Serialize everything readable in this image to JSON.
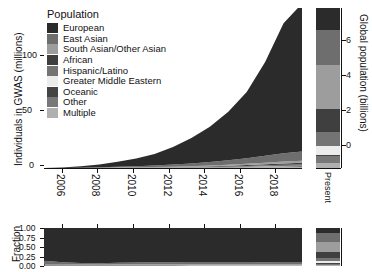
{
  "chart_data": {
    "type": "area",
    "title": "",
    "panels": {
      "main": {
        "type": "area",
        "ylabel": "Individuals in GWAS (millions)",
        "xlabel": "",
        "yticks": [
          0,
          50,
          100
        ],
        "ylim": [
          0,
          145
        ],
        "xticks": [
          "2006",
          "2008",
          "2010",
          "2012",
          "2014",
          "2016",
          "2018"
        ],
        "xlim": [
          2005,
          2019.5
        ],
        "grid": false,
        "x": [
          2005,
          2006,
          2007,
          2008,
          2009,
          2010,
          2011,
          2012,
          2013,
          2014,
          2015,
          2016,
          2017,
          2018,
          2019
        ],
        "series": [
          {
            "name": "European",
            "values": [
              0.1,
              0.4,
              1.2,
              2.6,
              4.5,
              7.0,
              10.5,
              16.0,
              23.0,
              32.0,
              44.0,
              60.0,
              85.0,
              118.0,
              134.0
            ]
          },
          {
            "name": "East Asian",
            "values": [
              0.0,
              0.1,
              0.2,
              0.4,
              0.7,
              1.0,
              1.4,
              1.9,
              2.5,
              3.2,
              4.0,
              5.0,
              6.2,
              7.5,
              8.4
            ]
          },
          {
            "name": "South Asian/Other Asian",
            "values": [
              0.0,
              0.0,
              0.05,
              0.1,
              0.15,
              0.2,
              0.3,
              0.4,
              0.5,
              0.7,
              0.9,
              1.1,
              1.4,
              1.7,
              1.9
            ]
          },
          {
            "name": "African",
            "values": [
              0.0,
              0.0,
              0.02,
              0.05,
              0.08,
              0.12,
              0.18,
              0.25,
              0.35,
              0.45,
              0.6,
              0.8,
              1.0,
              1.2,
              1.4
            ]
          },
          {
            "name": "Hispanic/Latino",
            "values": [
              0.0,
              0.0,
              0.02,
              0.04,
              0.07,
              0.1,
              0.15,
              0.2,
              0.3,
              0.4,
              0.5,
              0.65,
              0.85,
              1.0,
              1.15
            ]
          },
          {
            "name": "Greater Middle Eastern",
            "values": [
              0.0,
              0.0,
              0.0,
              0.01,
              0.02,
              0.03,
              0.04,
              0.06,
              0.08,
              0.1,
              0.13,
              0.16,
              0.2,
              0.24,
              0.27
            ]
          },
          {
            "name": "Oceanic",
            "values": [
              0.0,
              0.0,
              0.0,
              0.0,
              0.01,
              0.01,
              0.02,
              0.02,
              0.03,
              0.04,
              0.05,
              0.06,
              0.07,
              0.08,
              0.09
            ]
          },
          {
            "name": "Other",
            "values": [
              0.0,
              0.0,
              0.01,
              0.02,
              0.04,
              0.06,
              0.09,
              0.13,
              0.18,
              0.24,
              0.32,
              0.42,
              0.54,
              0.66,
              0.75
            ]
          },
          {
            "name": "Multiple",
            "values": [
              0.0,
              0.0,
              0.01,
              0.03,
              0.05,
              0.08,
              0.12,
              0.17,
              0.24,
              0.33,
              0.44,
              0.58,
              0.74,
              0.9,
              1.0
            ]
          }
        ]
      },
      "fraction": {
        "type": "area",
        "ylabel": "Fraction",
        "yticks": [
          "1.00",
          "0.75",
          "0.50",
          "0.25",
          "0.00"
        ],
        "ylim": [
          0,
          1
        ],
        "series": [
          {
            "name": "European",
            "values": [
              0.86,
              0.9,
              0.92,
              0.93,
              0.92,
              0.91,
              0.9,
              0.9,
              0.89,
              0.89,
              0.89,
              0.89,
              0.9,
              0.9,
              0.9
            ]
          },
          {
            "name": "East Asian",
            "values": [
              0.1,
              0.06,
              0.04,
              0.03,
              0.04,
              0.05,
              0.055,
              0.055,
              0.058,
              0.058,
              0.057,
              0.056,
              0.055,
              0.056,
              0.056
            ]
          },
          {
            "name": "South Asian/Other Asian",
            "values": [
              0.01,
              0.01,
              0.012,
              0.012,
              0.013,
              0.013,
              0.013,
              0.013,
              0.013,
              0.013,
              0.013,
              0.013,
              0.013,
              0.013,
              0.013
            ]
          },
          {
            "name": "African",
            "values": [
              0.01,
              0.01,
              0.009,
              0.009,
              0.009,
              0.009,
              0.009,
              0.009,
              0.009,
              0.009,
              0.009,
              0.009,
              0.009,
              0.009,
              0.009
            ]
          },
          {
            "name": "Hispanic/Latino",
            "values": [
              0.008,
              0.007,
              0.007,
              0.007,
              0.007,
              0.007,
              0.007,
              0.007,
              0.008,
              0.008,
              0.008,
              0.008,
              0.008,
              0.008,
              0.008
            ]
          },
          {
            "name": "Greater Middle Eastern",
            "values": [
              0.002,
              0.002,
              0.002,
              0.002,
              0.002,
              0.002,
              0.002,
              0.002,
              0.002,
              0.002,
              0.002,
              0.002,
              0.002,
              0.002,
              0.002
            ]
          },
          {
            "name": "Oceanic",
            "values": [
              0.001,
              0.001,
              0.001,
              0.001,
              0.001,
              0.001,
              0.001,
              0.001,
              0.001,
              0.001,
              0.001,
              0.001,
              0.001,
              0.001,
              0.001
            ]
          },
          {
            "name": "Other",
            "values": [
              0.004,
              0.005,
              0.005,
              0.005,
              0.005,
              0.005,
              0.005,
              0.005,
              0.005,
              0.005,
              0.005,
              0.005,
              0.005,
              0.005,
              0.005
            ]
          },
          {
            "name": "Multiple",
            "values": [
              0.005,
              0.005,
              0.005,
              0.006,
              0.006,
              0.007,
              0.008,
              0.008,
              0.009,
              0.009,
              0.009,
              0.009,
              0.009,
              0.009,
              0.009
            ]
          }
        ]
      },
      "present": {
        "type": "bar",
        "ylabel": "Global population (billions)",
        "xlabel": "Present",
        "yticks": [
          0,
          2,
          4,
          6
        ],
        "ylim": [
          0,
          7.6
        ],
        "segments": [
          {
            "name": "European",
            "value": 1.05
          },
          {
            "name": "East Asian",
            "value": 1.65
          },
          {
            "name": "South Asian/Other Asian",
            "value": 2.1
          },
          {
            "name": "African",
            "value": 1.1
          },
          {
            "name": "Hispanic/Latino",
            "value": 0.65
          },
          {
            "name": "Greater Middle Eastern",
            "value": 0.45
          },
          {
            "name": "Oceanic",
            "value": 0.05
          },
          {
            "name": "Other",
            "value": 0.3
          },
          {
            "name": "Multiple",
            "value": 0.25
          }
        ]
      },
      "present_fraction": {
        "type": "bar",
        "segments": [
          {
            "name": "European",
            "value": 0.14
          },
          {
            "name": "East Asian",
            "value": 0.22
          },
          {
            "name": "South Asian/Other Asian",
            "value": 0.28
          },
          {
            "name": "African",
            "value": 0.145
          },
          {
            "name": "Hispanic/Latino",
            "value": 0.085
          },
          {
            "name": "Greater Middle Eastern",
            "value": 0.06
          },
          {
            "name": "Oceanic",
            "value": 0.007
          },
          {
            "name": "Other",
            "value": 0.04
          },
          {
            "name": "Multiple",
            "value": 0.033
          }
        ]
      }
    },
    "legend": {
      "title": "Population",
      "position": "top-left-inside",
      "entries": [
        {
          "label": "European",
          "color": "#2b2b2b"
        },
        {
          "label": "East Asian",
          "color": "#6e6e6e"
        },
        {
          "label": "South Asian/Other Asian",
          "color": "#9d9d9d"
        },
        {
          "label": "African",
          "color": "#3f3f3f"
        },
        {
          "label": "Hispanic/Latino",
          "color": "#747474"
        },
        {
          "label": "Greater Middle Eastern",
          "color": "#ececec"
        },
        {
          "label": "Oceanic",
          "color": "#444444"
        },
        {
          "label": "Other",
          "color": "#787878"
        },
        {
          "label": "Multiple",
          "color": "#b0b0b0"
        }
      ]
    }
  }
}
